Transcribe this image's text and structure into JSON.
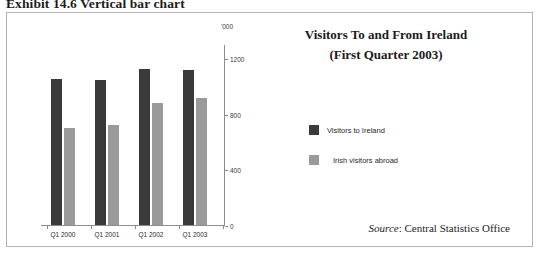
{
  "exhibit": {
    "caption": "Exhibit 14.6  Vertical bar chart"
  },
  "chart_data": {
    "type": "bar",
    "title": "Visitors To and From Ireland",
    "subtitle": "(First Quarter 2003)",
    "xlabel": "",
    "ylabel": "",
    "unit_label": "'000",
    "categories": [
      "Q1 2000",
      "Q1 2001",
      "Q1 2002",
      "Q1 2003"
    ],
    "series": [
      {
        "name": "Visitors to Ireland",
        "color": "#3a3a3a",
        "values": [
          1050,
          1040,
          1120,
          1115
        ]
      },
      {
        "name": "Irish visitors abroad",
        "color": "#9a9a9a",
        "values": [
          700,
          715,
          875,
          915
        ]
      }
    ],
    "ylim": [
      0,
      1300
    ],
    "yticks": [
      0,
      400,
      800,
      1200
    ],
    "ytick_labels": [
      "0",
      "400",
      "800",
      "1200"
    ],
    "grid": false,
    "legend_position": "right"
  },
  "source": {
    "label": "Source",
    "separator": ": ",
    "value": "Central Statistics Office"
  }
}
